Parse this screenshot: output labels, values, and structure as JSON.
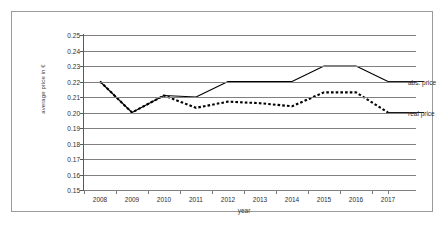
{
  "chart_data": {
    "type": "line",
    "title": "",
    "xlabel": "year",
    "ylabel": "average price in €",
    "categories": [
      "2008",
      "2009",
      "2010",
      "2011",
      "2012",
      "2013",
      "2014",
      "2015",
      "2016",
      "2017"
    ],
    "x": [
      2008,
      2009,
      2010,
      2011,
      2012,
      2013,
      2014,
      2015,
      2016,
      2017
    ],
    "ylim": [
      0.15,
      0.25
    ],
    "ytick_step": 0.01,
    "yticks": [
      "0.25",
      "0.24",
      "0.23",
      "0.22",
      "0.21",
      "0.20",
      "0.19",
      "0.18",
      "0.17",
      "0.16",
      "0.15"
    ],
    "ytick_values": [
      0.25,
      0.24,
      0.23,
      0.22,
      0.21,
      0.2,
      0.19,
      0.18,
      0.17,
      0.16,
      0.15
    ],
    "grid": true,
    "grid_axis": "y",
    "legend_position": "right-inline-at-line-end",
    "series": [
      {
        "name": "abs. price",
        "style": "solid",
        "color": "#000000",
        "values": [
          0.22,
          0.2,
          0.211,
          0.21,
          0.22,
          0.22,
          0.22,
          0.23,
          0.23,
          0.22
        ]
      },
      {
        "name": "real price",
        "style": "dashed",
        "color": "#000000",
        "values": [
          0.22,
          0.2,
          0.211,
          0.203,
          0.207,
          0.206,
          0.204,
          0.213,
          0.213,
          0.2
        ]
      }
    ]
  },
  "colors": {
    "background": "#ffffff",
    "frame_border": "#9a9a9a",
    "gridline": "#808080",
    "axis": "#5a5a5a",
    "text": "#2e2e2e",
    "series": "#000000"
  }
}
